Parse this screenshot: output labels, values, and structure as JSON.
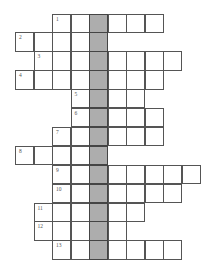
{
  "puzzle": {
    "type": "crossword",
    "key_column": 4,
    "colors": {
      "cell": "#ffffff",
      "key_column": "#adadad",
      "border": "#555555",
      "number": "#555555"
    },
    "geometry": {
      "origin_x": 15,
      "origin_y": 13.5,
      "cell_w": 18.5,
      "cell_h": 18.9
    },
    "rows": [
      {
        "clue": "1",
        "start_col": 2,
        "end_col": 7
      },
      {
        "clue": "2",
        "start_col": 0,
        "end_col": 4
      },
      {
        "clue": "3",
        "start_col": 1,
        "end_col": 8
      },
      {
        "clue": "4",
        "start_col": 0,
        "end_col": 7
      },
      {
        "clue": "5",
        "start_col": 3,
        "end_col": 6
      },
      {
        "clue": "6",
        "start_col": 3,
        "end_col": 7
      },
      {
        "clue": "7",
        "start_col": 2,
        "end_col": 7
      },
      {
        "clue": "8",
        "start_col": 0,
        "end_col": 4
      },
      {
        "clue": "9",
        "start_col": 2,
        "end_col": 9
      },
      {
        "clue": "10",
        "start_col": 2,
        "end_col": 8
      },
      {
        "clue": "11",
        "start_col": 1,
        "end_col": 6
      },
      {
        "clue": "12",
        "start_col": 1,
        "end_col": 5
      },
      {
        "clue": "13",
        "start_col": 2,
        "end_col": 8
      }
    ]
  }
}
